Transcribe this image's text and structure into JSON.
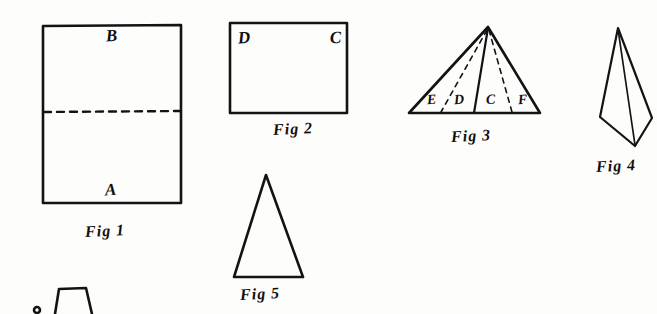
{
  "plate": {
    "background_color": "#fdfdfc",
    "ink_color": "#141313",
    "width": 657,
    "height": 314
  },
  "figures": [
    {
      "id": "fig-1",
      "caption": "Fig 1",
      "shape": "rectangle-with-horizontal-fold-line",
      "vertex_labels": [
        {
          "text": "B",
          "position": "upper-middle"
        },
        {
          "text": "A",
          "position": "lower-middle"
        }
      ],
      "fold_line": "dashed-horizontal-midline"
    },
    {
      "id": "fig-2",
      "caption": "Fig 2",
      "shape": "rectangle",
      "vertex_labels": [
        {
          "text": "D",
          "position": "top-left"
        },
        {
          "text": "C",
          "position": "top-right"
        }
      ]
    },
    {
      "id": "fig-3",
      "caption": "Fig 3",
      "shape": "triangle-with-internal-fold-lines",
      "vertex_labels": [
        {
          "text": "E",
          "position": "base-left"
        },
        {
          "text": "D",
          "position": "base-center-left"
        },
        {
          "text": "C",
          "position": "base-center-right"
        },
        {
          "text": "F",
          "position": "base-right"
        }
      ],
      "internal_lines": "two-dashed-creases-and-one-solid-median"
    },
    {
      "id": "fig-4",
      "caption": "Fig 4",
      "shape": "kite-with-vertical-center-line",
      "vertex_labels": []
    },
    {
      "id": "fig-5",
      "caption": "Fig 5",
      "shape": "tall-isosceles-triangle",
      "vertex_labels": []
    },
    {
      "id": "fig-6-partial",
      "caption": "",
      "shape": "trapezoid-cropped-at-bottom-edge",
      "vertex_labels": []
    }
  ],
  "captions": {
    "fig1": "Fig 1",
    "fig2": "Fig 2",
    "fig3": "Fig 3",
    "fig4": "Fig 4",
    "fig5": "Fig 5"
  },
  "labels": {
    "fig1_top": "B",
    "fig1_bottom": "A",
    "fig2_topleft": "D",
    "fig2_topright": "C",
    "fig3_base_e": "E",
    "fig3_base_d": "D",
    "fig3_base_c": "C",
    "fig3_base_f": "F"
  }
}
